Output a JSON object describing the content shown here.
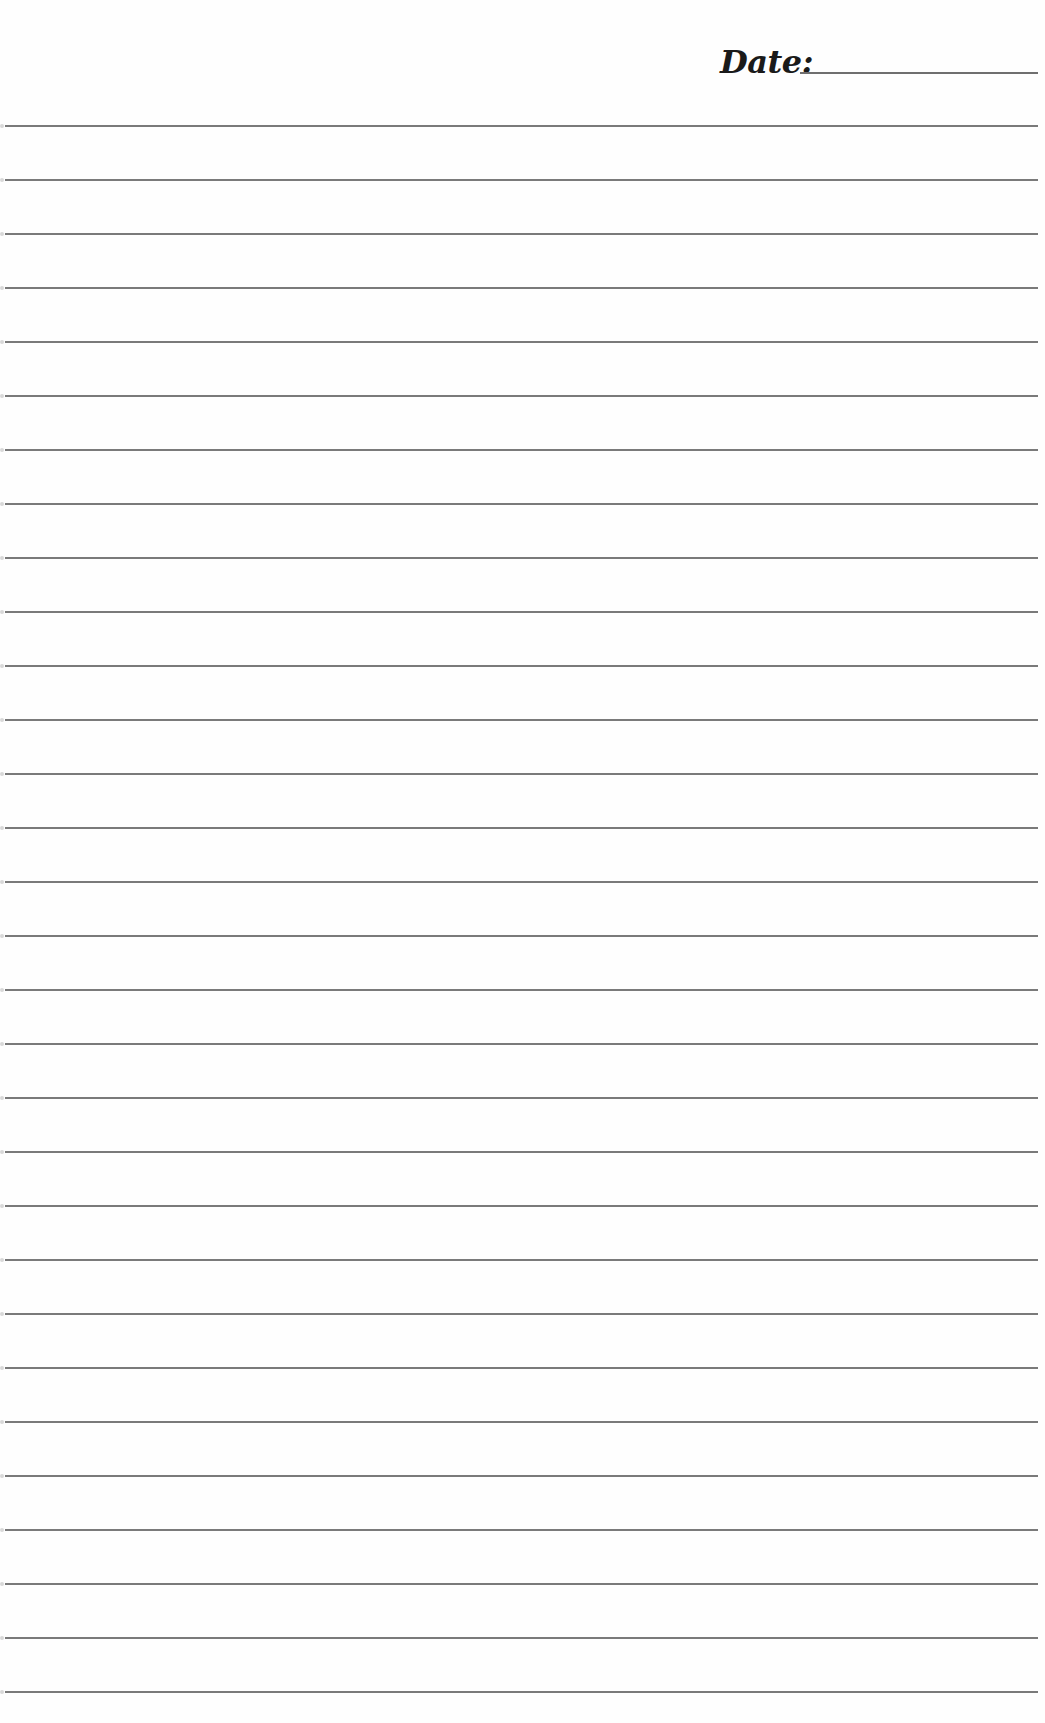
{
  "header": {
    "date_label": "Date:",
    "date_value": ""
  },
  "page": {
    "type": "lined-writing-paper",
    "line_count": 30,
    "first_line_y": 125,
    "line_spacing_px": 54,
    "line_color": "#7a7a7a",
    "background_color": "#fefefe"
  }
}
